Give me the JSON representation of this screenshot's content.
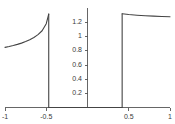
{
  "chart_data": {
    "type": "line",
    "title": "",
    "subtitle": "",
    "xlabel": "",
    "ylabel": "",
    "xlim": [
      -1,
      1
    ],
    "ylim": [
      0,
      1.35
    ],
    "grid": false,
    "legend": null,
    "axis_color": "#555555",
    "curve_color": "#444444",
    "xticks": [
      -1,
      -0.5,
      0.5,
      1
    ],
    "xtick_labels": [
      "-1",
      "-0.5",
      "0.5",
      "1"
    ],
    "yticks": [
      0.2,
      0.4,
      0.6,
      0.8,
      1,
      1.2
    ],
    "ytick_labels": [
      "0.2",
      "0.4",
      "0.6",
      "0.8",
      "1",
      "1.2"
    ],
    "series": [
      {
        "name": "branch-left",
        "x": [
          -1.0,
          -0.95,
          -0.9,
          -0.85,
          -0.8,
          -0.75,
          -0.7,
          -0.65,
          -0.6,
          -0.55,
          -0.5,
          -0.47
        ],
        "values": [
          0.85,
          0.862,
          0.876,
          0.892,
          0.91,
          0.932,
          0.958,
          0.99,
          1.03,
          1.085,
          1.185,
          1.32
        ]
      },
      {
        "name": "drop-left",
        "x": [
          -0.47,
          -0.47
        ],
        "values": [
          1.32,
          0.0
        ]
      },
      {
        "name": "branch-zero",
        "x": [
          -0.47,
          0.42
        ],
        "values": [
          0.0,
          0.0
        ]
      },
      {
        "name": "rise-right",
        "x": [
          0.42,
          0.42
        ],
        "values": [
          0.0,
          1.325
        ]
      },
      {
        "name": "branch-right",
        "x": [
          0.42,
          0.5,
          0.6,
          0.7,
          0.8,
          0.9,
          1.0
        ],
        "values": [
          1.325,
          1.315,
          1.305,
          1.297,
          1.291,
          1.286,
          1.282
        ]
      }
    ]
  },
  "axes": {
    "x_axis_name": "x-axis",
    "y_axis_name": "y-axis"
  }
}
